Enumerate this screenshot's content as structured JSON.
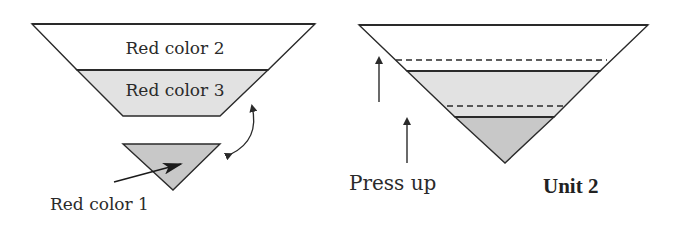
{
  "diagram": {
    "left_funnel": {
      "top_layer": {
        "label": "Red color 2",
        "fill": "#ffffff"
      },
      "middle_layer": {
        "label": "Red color 3",
        "fill": "#e2e2e2"
      }
    },
    "detached_tip": {
      "label": "Red color 1",
      "fill": "#c8c8c8"
    },
    "right_funnel": {
      "layers": [
        {
          "name": "top",
          "fill": "#ffffff"
        },
        {
          "name": "middle",
          "fill": "#e2e2e2"
        },
        {
          "name": "bottom",
          "fill": "#c8c8c8"
        }
      ],
      "arrow_label": "Press up",
      "caption": "Unit 2"
    },
    "colors": {
      "stroke": "#2a2a2a",
      "light_fill": "#e2e2e2",
      "dark_fill": "#c8c8c8"
    }
  }
}
